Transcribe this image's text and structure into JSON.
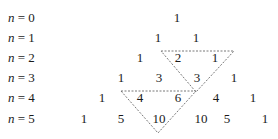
{
  "diagram": {
    "rows": [
      {
        "label_var": "n",
        "label_eq": " = 0",
        "values": [
          "1"
        ]
      },
      {
        "label_var": "n",
        "label_eq": " = 1",
        "values": [
          "1",
          "1"
        ]
      },
      {
        "label_var": "n",
        "label_eq": " = 2",
        "values": [
          "1",
          "2",
          "1"
        ]
      },
      {
        "label_var": "n",
        "label_eq": " = 3",
        "values": [
          "1",
          "3",
          "3",
          "1"
        ]
      },
      {
        "label_var": "n",
        "label_eq": " = 4",
        "values": [
          "1",
          "4",
          "6",
          "4",
          "1"
        ]
      },
      {
        "label_var": "n",
        "label_eq": " = 5",
        "values": [
          "1",
          "5",
          "10",
          "10",
          "5",
          "1"
        ]
      }
    ],
    "highlights": [
      {
        "description": "2 + 1 = 3",
        "entries": [
          "2",
          "1",
          "3"
        ],
        "style": "dashed-triangle"
      },
      {
        "description": "4 + 6 = 10",
        "entries": [
          "4",
          "6",
          "10"
        ],
        "style": "dashed-triangle"
      }
    ],
    "line_color": "#555555",
    "text_color": "#1a1a1a"
  }
}
